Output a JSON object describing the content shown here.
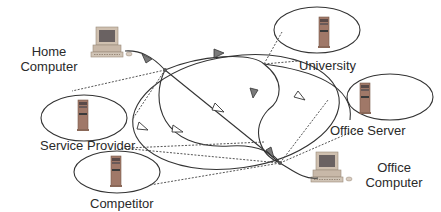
{
  "diagram": {
    "type": "network-diagram",
    "nodes": [
      {
        "id": "home",
        "label_line1": "Home",
        "label_line2": "Computer",
        "kind": "desktop-computer"
      },
      {
        "id": "service",
        "label": "Service Provider",
        "kind": "server-in-domain"
      },
      {
        "id": "competitor",
        "label": "Competitor",
        "kind": "server-in-domain"
      },
      {
        "id": "university",
        "label": "University",
        "kind": "server-in-domain"
      },
      {
        "id": "officeserver",
        "label": "Office Server",
        "kind": "server-in-domain"
      },
      {
        "id": "officecomp",
        "label_line1": "Office",
        "label_line2": "Computer",
        "kind": "desktop-computer"
      }
    ],
    "colors": {
      "line": "#3a3a3a",
      "dotted": "#555555",
      "arrow_filled": "#777777",
      "arrow_hollow": "#ffffff",
      "server_body": "#a07060",
      "monitor_body": "#c8b8a8",
      "monitor_screen": "#6a6060"
    }
  }
}
